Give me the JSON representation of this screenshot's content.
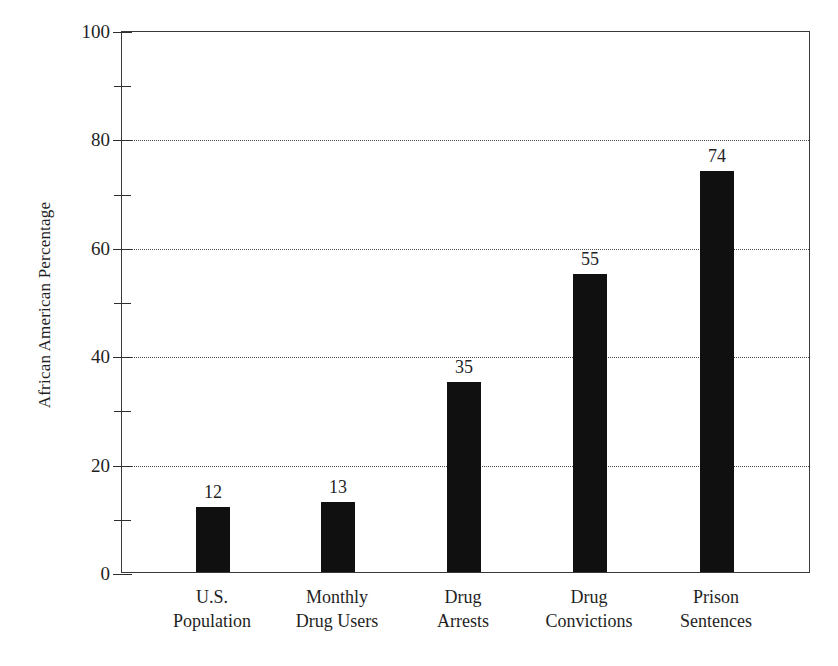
{
  "chart_data": {
    "type": "bar",
    "title": "",
    "subtitle": "",
    "xlabel": "",
    "ylabel": "African American Percentage",
    "ylim": [
      0,
      100
    ],
    "y_major_ticks": [
      0,
      20,
      40,
      60,
      80,
      100
    ],
    "y_minor_ticks": [
      10,
      30,
      50,
      70,
      90
    ],
    "y_tick_labels": [
      "0",
      "20",
      "40",
      "60",
      "80",
      "100"
    ],
    "grid": "horizontal-dotted-major-only",
    "legend": "none",
    "bar_color": "#101010",
    "frame_color": "#3a3a3a",
    "background": "#ffffff",
    "categories": [
      "U.S. Population",
      "Monthly Drug Users",
      "Drug Arrests",
      "Drug Convictions",
      "Prison Sentences"
    ],
    "values": [
      12,
      13,
      35,
      55,
      74
    ],
    "data_labels": [
      "12",
      "13",
      "35",
      "55",
      "74"
    ],
    "bars": [
      {
        "label_line1": "U.S.",
        "label_line2": "Population",
        "value": 12,
        "data_label": "12"
      },
      {
        "label_line1": "Monthly",
        "label_line2": "Drug Users",
        "value": 13,
        "data_label": "13"
      },
      {
        "label_line1": "Drug",
        "label_line2": "Arrests",
        "value": 35,
        "data_label": "35"
      },
      {
        "label_line1": "Drug",
        "label_line2": "Convictions",
        "value": 55,
        "data_label": "55"
      },
      {
        "label_line1": "Prison",
        "label_line2": "Sentences",
        "value": 74,
        "data_label": "74"
      }
    ]
  }
}
